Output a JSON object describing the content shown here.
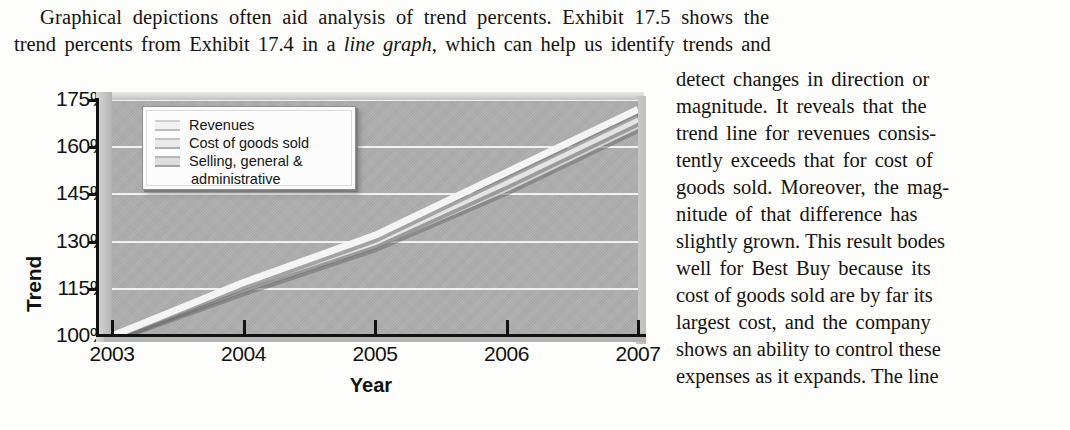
{
  "lead_paragraph": {
    "line1_a": "Graphical depictions often aid analysis of trend percents. Exhibit 17.5 shows the",
    "line2_a": "trend percents from Exhibit 17.4 in a ",
    "line2_italic": "line graph,",
    "line2_b": " which can help us identify trends and"
  },
  "right_column": {
    "lines": [
      "detect changes in direction or",
      "magnitude. It reveals that the",
      "trend line for revenues consis-",
      "tently exceeds that for cost of",
      "goods sold. Moreover, the mag-",
      "nitude of that difference has",
      "slightly grown. This result bodes",
      "well for Best Buy because its",
      "cost of goods sold are by far its",
      "largest cost, and the company",
      "shows an ability to control these",
      "expenses as it expands. The line"
    ]
  },
  "chart_data": {
    "type": "line",
    "title": "",
    "xlabel": "Year",
    "ylabel": "Trend",
    "categories": [
      "2003",
      "2004",
      "2005",
      "2006",
      "2007"
    ],
    "x": [
      2003,
      2004,
      2005,
      2006,
      2007
    ],
    "ylim": [
      100,
      175
    ],
    "xlim": [
      2003,
      2007
    ],
    "yticks": [
      "100%",
      "115%",
      "130%",
      "145%",
      "160%",
      "175%"
    ],
    "ytick_values": [
      100,
      115,
      130,
      145,
      160,
      175
    ],
    "grid": true,
    "legend_position": "upper-left-inside",
    "series": [
      {
        "name": "Revenues",
        "values": [
          100,
          117,
          132,
          152,
          172
        ],
        "color": "#f4f4f4"
      },
      {
        "name": "Cost of goods sold",
        "values": [
          100,
          116,
          130,
          149,
          169
        ],
        "color": "#e4e4e4"
      },
      {
        "name": "Selling, general & administrative",
        "values": [
          100,
          115,
          129,
          147,
          167
        ],
        "color": "#d2d2d2"
      }
    ],
    "legend_entries": [
      {
        "label": "Revenues",
        "label_cont": ""
      },
      {
        "label": "Cost of goods sold",
        "label_cont": ""
      },
      {
        "label": "Selling, general &",
        "label_cont": "administrative"
      }
    ],
    "plot_background": "#aeaeae",
    "gridline_color": "#f2f2f2",
    "axis_color": "#121212"
  }
}
